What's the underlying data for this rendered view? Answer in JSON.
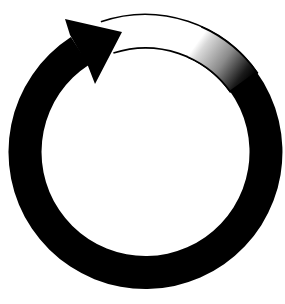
{
  "diagram": {
    "type": "circular-cycle-arrow",
    "direction": "clockwise",
    "colors": {
      "background": "#ffffff",
      "arrow_fill": "#000000",
      "outline": "#000000",
      "gradient_start": "#ffffff",
      "gradient_mid": "#9a9a9a",
      "gradient_end": "#000000"
    },
    "segments": [
      {
        "name": "solid-arc",
        "fill": "black"
      },
      {
        "name": "outlined-arc",
        "fill": "white"
      },
      {
        "name": "gradient-arc",
        "fill": "white-to-black"
      }
    ],
    "arrowhead": {
      "position": "upper-left",
      "pointing": "right"
    }
  }
}
